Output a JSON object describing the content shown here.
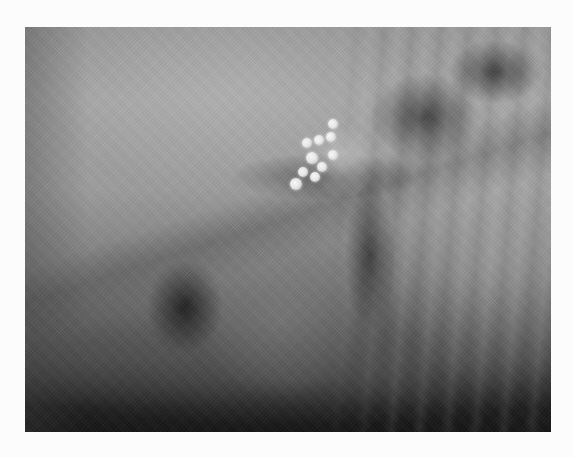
{
  "image": {
    "kind": "radiograph",
    "description": "Lateral thoracic radiograph showing a cluster of bright, rounded radiopaque densities in the dorsal mid-thorax with a central cardiac silhouette and rib shadows",
    "colors": {
      "background": "#fcfcfc",
      "film_light": "#a6a6a6",
      "film_dark": "#151515",
      "radiopaque": "#ffffff"
    },
    "foreign_bodies": [
      {
        "x": 307,
        "y": 143,
        "r": 5
      },
      {
        "x": 319,
        "y": 140,
        "r": 5
      },
      {
        "x": 331,
        "y": 137,
        "r": 5
      },
      {
        "x": 312,
        "y": 158,
        "r": 6
      },
      {
        "x": 322,
        "y": 167,
        "r": 5
      },
      {
        "x": 333,
        "y": 155,
        "r": 5
      },
      {
        "x": 315,
        "y": 177,
        "r": 5
      },
      {
        "x": 303,
        "y": 172,
        "r": 5
      },
      {
        "x": 333,
        "y": 124,
        "r": 5
      },
      {
        "x": 296,
        "y": 184,
        "r": 6
      }
    ]
  }
}
